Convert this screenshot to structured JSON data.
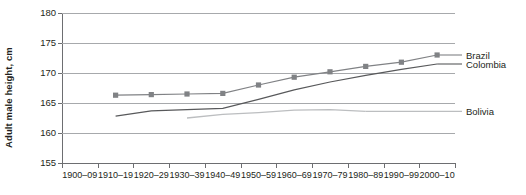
{
  "chart_data": {
    "type": "line",
    "title": "",
    "subtitle": "",
    "xlabel": "",
    "ylabel": "Adult male height, cm",
    "ylim": [
      155,
      180
    ],
    "yticks": [
      155,
      160,
      165,
      170,
      175,
      180
    ],
    "ytick_labels": [
      "155",
      "160",
      "165",
      "170",
      "175",
      "180"
    ],
    "grid": true,
    "grid_axis": "y",
    "legend_position": "right-inline",
    "categories": [
      "1900–09",
      "1910–19",
      "1920–29",
      "1930–39",
      "1940–49",
      "1950–59",
      "1960–69",
      "1970–79",
      "1980–89",
      "1990–99",
      "2000–10"
    ],
    "series": [
      {
        "name": "Brazil",
        "color": "#808285",
        "marker": "square",
        "values": [
          null,
          166.3,
          166.4,
          166.5,
          166.6,
          168.0,
          169.3,
          170.2,
          171.1,
          171.8,
          173.0
        ]
      },
      {
        "name": "Colombia",
        "color": "#58595b",
        "marker": "none",
        "values": [
          null,
          162.8,
          163.7,
          163.9,
          164.1,
          165.6,
          167.2,
          168.5,
          169.6,
          170.6,
          171.5
        ]
      },
      {
        "name": "Bolivia",
        "color": "#bcbec0",
        "marker": "none",
        "values": [
          null,
          null,
          null,
          162.5,
          163.1,
          163.4,
          163.8,
          163.9,
          163.6,
          null,
          null
        ]
      }
    ]
  },
  "labels": {
    "brazil": "Brazil",
    "colombia": "Colombia",
    "bolivia": "Bolivia"
  },
  "axes": {
    "y_title": "Adult male height, cm"
  }
}
